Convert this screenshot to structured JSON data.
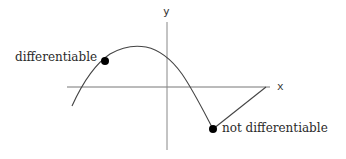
{
  "diagram": {
    "title": "",
    "axes": {
      "x_label": "x",
      "y_label": "y"
    },
    "points": [
      {
        "label": "differentiable",
        "description": "smooth point on curve"
      },
      {
        "label": "not differentiable",
        "description": "corner point on curve"
      }
    ],
    "colors": {
      "curve": "#444444",
      "axes": "#666666",
      "points": "#000000",
      "text": "#2a2a2a"
    }
  }
}
